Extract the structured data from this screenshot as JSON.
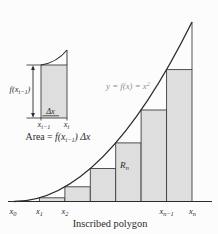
{
  "figure": {
    "caption": "Inscribed polygon",
    "curve_equation": {
      "pre": "y = f(x) = x",
      "sup": "2"
    },
    "region_label": {
      "base": "R",
      "sub": "n"
    },
    "axis_labels": [
      {
        "base": "x",
        "sub": "0"
      },
      {
        "base": "x",
        "sub": "1"
      },
      {
        "base": "x",
        "sub": "2"
      },
      {
        "base": "x",
        "sub": "n−1"
      },
      {
        "base": "x",
        "sub": "n"
      }
    ]
  },
  "inset": {
    "height_label": {
      "pre": "f(x",
      "sub": "i−1",
      "post": ")"
    },
    "width_label": "Δx",
    "left_base_label": {
      "base": "x",
      "sub": "i−1"
    },
    "right_base_label": {
      "base": "x",
      "sub": "i"
    },
    "area_formula": {
      "word": "Area = ",
      "fx": "f(x",
      "sub": "i−1",
      "close": ") Δx"
    }
  },
  "colors": {
    "background": "#fcfcfc",
    "rectangle_fill": "#dedede",
    "line": "#2b2b2b",
    "equation_gray": "#8f8f8f"
  }
}
